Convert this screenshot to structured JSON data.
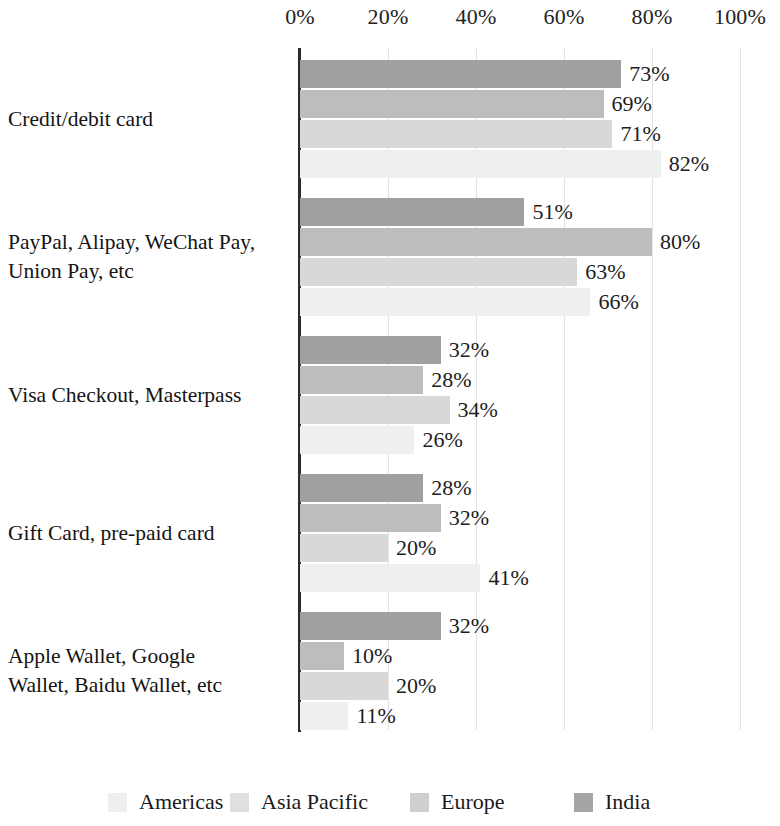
{
  "chart_data": {
    "type": "bar",
    "orientation": "horizontal",
    "title": "",
    "xlabel": "",
    "ylabel": "",
    "xlim": [
      0,
      100
    ],
    "xticks": [
      "0%",
      "20%",
      "40%",
      "60%",
      "80%",
      "100%"
    ],
    "xtick_values": [
      0,
      20,
      40,
      60,
      80,
      100
    ],
    "grid": true,
    "legend_position": "bottom",
    "value_suffix": "%",
    "categories": [
      "Credit/debit card",
      "PayPal, Alipay, WeChat Pay, Union Pay, etc",
      "Visa Checkout, Masterpass",
      "Gift Card, pre-paid card",
      "Apple Wallet, Google Wallet, Baidu Wallet, etc"
    ],
    "category_lines": [
      [
        "Credit/debit card"
      ],
      [
        "PayPal, Alipay, WeChat Pay,",
        "Union Pay, etc"
      ],
      [
        "Visa Checkout, Masterpass"
      ],
      [
        "Gift Card, pre-paid card"
      ],
      [
        "Apple Wallet, Google",
        "Wallet, Baidu Wallet, etc"
      ]
    ],
    "series": [
      {
        "name": "India",
        "color": "#a0a0a0",
        "values": [
          73,
          51,
          32,
          28,
          32
        ],
        "labels": [
          "73%",
          "51%",
          "32%",
          "28%",
          "32%"
        ]
      },
      {
        "name": "Europe",
        "color": "#bdbdbd",
        "values": [
          69,
          80,
          28,
          32,
          10
        ],
        "labels": [
          "69%",
          "80%",
          "28%",
          "32%",
          "10%"
        ]
      },
      {
        "name": "Asia Pacific",
        "color": "#d8d8d8",
        "values": [
          71,
          63,
          34,
          20,
          20
        ],
        "labels": [
          "71%",
          "63%",
          "34%",
          "20%",
          "20%"
        ]
      },
      {
        "name": "Americas",
        "color": "#efefef",
        "values": [
          82,
          66,
          26,
          41,
          11
        ],
        "labels": [
          "82%",
          "66%",
          "26%",
          "41%",
          "11%"
        ]
      }
    ],
    "legend": [
      {
        "label": "Americas",
        "color": "#efefef"
      },
      {
        "label": "Asia Pacific",
        "color": "#e0e0e0"
      },
      {
        "label": "Europe",
        "color": "#cfcfcf"
      },
      {
        "label": "India",
        "color": "#a5a5a5"
      }
    ],
    "axis_color": "#2b2b2b",
    "gridline_color": "#e2e2e2"
  }
}
